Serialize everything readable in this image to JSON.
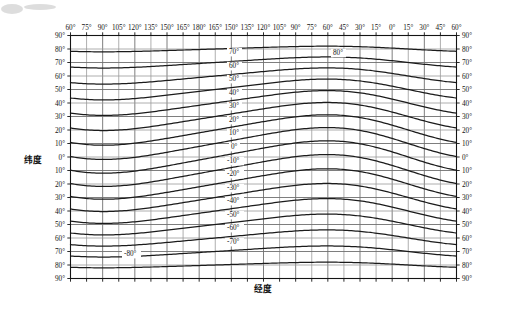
{
  "chart_data": {
    "type": "line",
    "title": "",
    "xlabel": "经度",
    "ylabel": "纬度",
    "grid": true,
    "legend": "none",
    "x_ticks": [
      "60°",
      "75°",
      "90°",
      "105°",
      "120°",
      "135°",
      "150°",
      "165°",
      "180°",
      "165°",
      "150°",
      "135°",
      "120°",
      "105°",
      "90°",
      "75°",
      "60°",
      "45°",
      "30°",
      "15°",
      "0°",
      "15°",
      "30°",
      "45°",
      "60°"
    ],
    "x_tick_values": [
      60,
      75,
      90,
      105,
      120,
      135,
      150,
      165,
      180,
      195,
      210,
      225,
      240,
      255,
      270,
      285,
      300,
      315,
      330,
      345,
      360,
      375,
      390,
      405,
      420
    ],
    "xlim": [
      60,
      420
    ],
    "y_ticks_left": [
      "90°",
      "80°",
      "70°",
      "60°",
      "50°",
      "40°",
      "30°",
      "20°",
      "10°",
      "0°",
      "10°",
      "20°",
      "30°",
      "40°",
      "50°",
      "60°",
      "70°",
      "80°",
      "90°"
    ],
    "y_ticks_right": [
      "90°",
      "80°",
      "70°",
      "60°",
      "50°",
      "40°",
      "30°",
      "20°",
      "10°",
      "0°",
      "10°",
      "20°",
      "30°",
      "40°",
      "50°",
      "60°",
      "70°",
      "80°",
      "90°"
    ],
    "y_tick_values": [
      90,
      80,
      70,
      60,
      50,
      40,
      30,
      20,
      10,
      0,
      -10,
      -20,
      -30,
      -40,
      -50,
      -60,
      -70,
      -80,
      -90
    ],
    "ylim": [
      -90,
      90
    ],
    "corner_labels": {
      "top_left": "90°",
      "top_right": "90°",
      "bottom_left": "90°",
      "bottom_right": "90°"
    },
    "series": [
      {
        "name": "geomagnetic-latitude-80",
        "label": "80°",
        "label_x": 333,
        "label_y": 55
      },
      {
        "name": "geomagnetic-latitude-70",
        "label": "70°",
        "label_x": 229,
        "label_y": 54
      },
      {
        "name": "geomagnetic-latitude-60",
        "label": "60°",
        "label_x": 229,
        "label_y": 68
      },
      {
        "name": "geomagnetic-latitude-50",
        "label": "50°",
        "label_x": 229,
        "label_y": 81
      },
      {
        "name": "geomagnetic-latitude-40",
        "label": "40°",
        "label_x": 229,
        "label_y": 95
      },
      {
        "name": "geomagnetic-latitude-30",
        "label": "30°",
        "label_x": 229,
        "label_y": 108
      },
      {
        "name": "geomagnetic-latitude-20",
        "label": "20°",
        "label_x": 229,
        "label_y": 122
      },
      {
        "name": "geomagnetic-latitude-10",
        "label": "10°",
        "label_x": 229,
        "label_y": 135
      },
      {
        "name": "geomagnetic-latitude-0",
        "label": "0°",
        "label_x": 231,
        "label_y": 149
      },
      {
        "name": "geomagnetic-latitude-minus10",
        "label": "-10°",
        "label_x": 227,
        "label_y": 163
      },
      {
        "name": "geomagnetic-latitude-minus20",
        "label": "-20°",
        "label_x": 227,
        "label_y": 176
      },
      {
        "name": "geomagnetic-latitude-minus30",
        "label": "-30°",
        "label_x": 227,
        "label_y": 190
      },
      {
        "name": "geomagnetic-latitude-minus40",
        "label": "-40°",
        "label_x": 227,
        "label_y": 203
      },
      {
        "name": "geomagnetic-latitude-minus50",
        "label": "-50°",
        "label_x": 227,
        "label_y": 217
      },
      {
        "name": "geomagnetic-latitude-minus60",
        "label": "-60°",
        "label_x": 227,
        "label_y": 230
      },
      {
        "name": "geomagnetic-latitude-minus70",
        "label": "-70°",
        "label_x": 227,
        "label_y": 244
      },
      {
        "name": "geomagnetic-latitude-minus80",
        "label": "-80°",
        "label_x": 124,
        "label_y": 256
      }
    ]
  }
}
